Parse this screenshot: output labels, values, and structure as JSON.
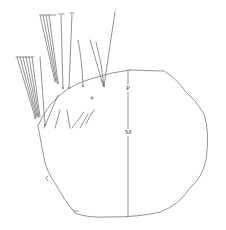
{
  "figure": {
    "labels": {
      "p": "P",
      "m": "M"
    },
    "colors": {
      "stroke": "#777777",
      "background": "#ffffff"
    }
  }
}
